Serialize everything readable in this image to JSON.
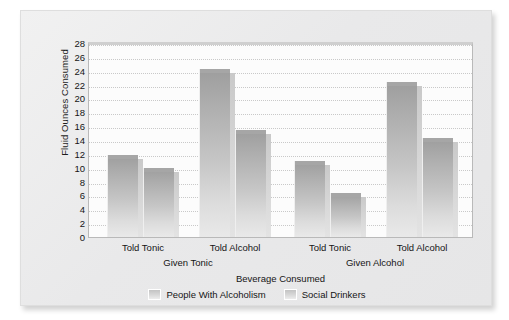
{
  "chart_data": {
    "type": "bar",
    "title": "",
    "xlabel": "Beverage Consumed",
    "ylabel": "Fluid Ounces Consumed",
    "ylim": [
      0,
      28
    ],
    "ytick_step": 2,
    "yticks": [
      28,
      26,
      24,
      22,
      20,
      18,
      16,
      14,
      12,
      10,
      8,
      6,
      4,
      2,
      0
    ],
    "grid": true,
    "legend_position": "bottom",
    "groups": [
      {
        "label": "Given Tonic",
        "subgroups": [
          "Told Tonic",
          "Told Alcohol"
        ]
      },
      {
        "label": "Given Alcohol",
        "subgroups": [
          "Told Tonic",
          "Told Alcohol"
        ]
      }
    ],
    "categories": [
      "Given Tonic / Told Tonic",
      "Given Tonic / Told Alcohol",
      "Given Alcohol / Told Tonic",
      "Given Alcohol / Told Alcohol"
    ],
    "series": [
      {
        "name": "People With Alcoholism",
        "color": "#b4b4b4",
        "values": [
          11.9,
          24.2,
          10.9,
          22.4
        ]
      },
      {
        "name": "Social Drinkers",
        "color": "#b4b4b4",
        "values": [
          10.0,
          15.4,
          6.3,
          14.3
        ]
      }
    ],
    "bars": [
      {
        "label": "Told Tonic",
        "series": "People With Alcoholism",
        "group": "Given Tonic",
        "value": 11.9
      },
      {
        "label": "Told Tonic",
        "series": "Social Drinkers",
        "group": "Given Tonic",
        "value": 10.0
      },
      {
        "label": "Told Alcohol",
        "series": "People With Alcoholism",
        "group": "Given Tonic",
        "value": 24.2
      },
      {
        "label": "Told Alcohol",
        "series": "Social Drinkers",
        "group": "Given Tonic",
        "value": 15.4
      },
      {
        "label": "Told Tonic",
        "series": "People With Alcoholism",
        "group": "Given Alcohol",
        "value": 10.9
      },
      {
        "label": "Told Tonic",
        "series": "Social Drinkers",
        "group": "Given Alcohol",
        "value": 6.3
      },
      {
        "label": "Told Alcohol",
        "series": "People With Alcoholism",
        "group": "Given Alcohol",
        "value": 22.4
      },
      {
        "label": "Told Alcohol",
        "series": "Social Drinkers",
        "group": "Given Alcohol",
        "value": 14.3
      }
    ],
    "legend": [
      {
        "label": "People With Alcoholism"
      },
      {
        "label": "Social Drinkers"
      }
    ]
  },
  "axis": {
    "y_title": "Fluid Ounces Consumed",
    "x_title": "Beverage Consumed",
    "y_tick_labels": [
      "28",
      "26",
      "24",
      "22",
      "20",
      "18",
      "16",
      "14",
      "12",
      "10",
      "8",
      "6",
      "4",
      "2",
      "0"
    ],
    "x_tick_labels": [
      "Told Tonic",
      "Told Alcohol",
      "Told Tonic",
      "Told Alcohol"
    ],
    "x_group_labels": [
      "Given Tonic",
      "Given Alcohol"
    ]
  },
  "legend": {
    "items": [
      {
        "label": "People With Alcoholism",
        "swatch": "legend-swatch-alcoholism"
      },
      {
        "label": "Social Drinkers",
        "swatch": "legend-swatch-social"
      }
    ]
  }
}
